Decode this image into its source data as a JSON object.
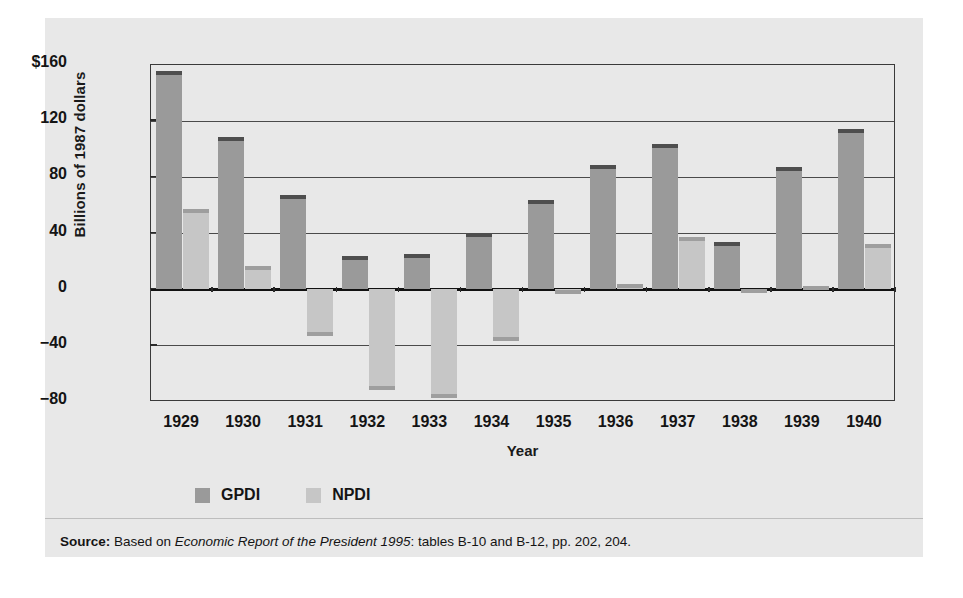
{
  "chart_data": {
    "type": "bar",
    "title": "",
    "xlabel": "Year",
    "ylabel": "Billions of 1987 dollars",
    "categories": [
      "1929",
      "1930",
      "1931",
      "1932",
      "1933",
      "1934",
      "1935",
      "1936",
      "1937",
      "1938",
      "1939",
      "1940"
    ],
    "ylim": [
      -80,
      160
    ],
    "yticks": [
      -80,
      -40,
      0,
      40,
      80,
      120,
      160
    ],
    "ytick_labels": [
      "−80",
      "−40",
      "0",
      "40",
      "80",
      "120",
      "$160"
    ],
    "grid": true,
    "legend_position": "below-axes-left",
    "series": [
      {
        "name": "GPDI",
        "color": "#9a9a9a",
        "values": [
          155,
          108,
          67,
          23,
          25,
          40,
          63,
          88,
          103,
          33,
          87,
          114
        ]
      },
      {
        "name": "NPDI",
        "color": "#c6c6c6",
        "values": [
          57,
          16,
          -34,
          -72,
          -78,
          -37,
          -4,
          3,
          37,
          -3,
          2,
          32
        ]
      }
    ]
  },
  "source": {
    "label": "Source:",
    "lead": " Based on ",
    "italic": "Economic Report of the President 1995",
    "tail": ": tables B-10 and B-12, pp. 202, 204."
  }
}
